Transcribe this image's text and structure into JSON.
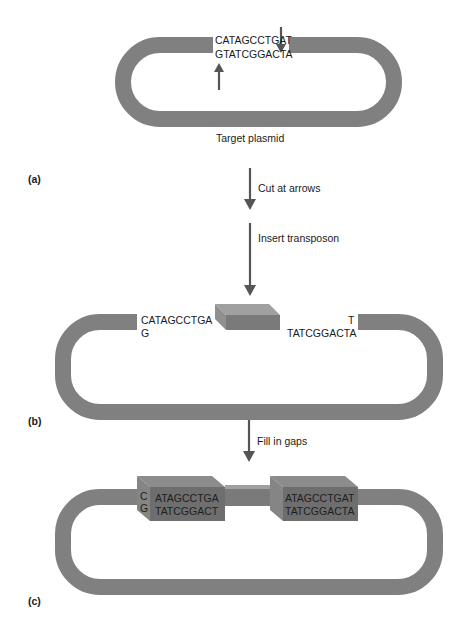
{
  "colors": {
    "background": "#ffffff",
    "plasmid": "#808080",
    "arrow": "#555555",
    "transposon_front": "#7a7a7a",
    "transposon_top": "#a0a0a0",
    "transposon_side": "#909090",
    "filled_block_front": "#6e6e6e",
    "filled_block_top": "#8c8c8c",
    "filled_block_side": "#858585",
    "text": "#1a1a1a"
  },
  "panel_a": {
    "label": "(a)",
    "top_strand": "CATAGCCTGAT",
    "bottom_strand": "GTATCGGACTA",
    "plasmid_label": "Target plasmid"
  },
  "step_1": {
    "label": "Cut at arrows"
  },
  "step_2": {
    "label": "Insert transposon"
  },
  "panel_b": {
    "label": "(b)",
    "left_top_strand": "CATAGCCTGA",
    "left_bottom_strand": "G",
    "right_top_strand": "T",
    "right_bottom_strand": "TATCGGACTA"
  },
  "step_3": {
    "label": "Fill in gaps"
  },
  "panel_c": {
    "label": "(c)",
    "left_overhang_top": "C",
    "left_overhang_bottom": "G",
    "left_block_top": "ATAGCCTGA",
    "left_block_bottom": "TATCGGACT",
    "right_block_top": "ATAGCCTGAT",
    "right_block_bottom": "TATCGGACTA"
  }
}
